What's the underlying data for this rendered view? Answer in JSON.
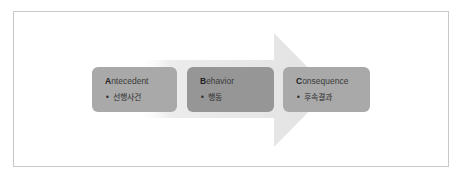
{
  "diagram": {
    "type": "process-arrow",
    "arrow_color": "#e4e4e4",
    "frame_border_color": "#c8c8c8",
    "steps": [
      {
        "initial": "A",
        "rest": "ntecedent",
        "title": "Antecedent",
        "bullet": "•",
        "subtitle": "선행사건",
        "color": "#a9a9a9"
      },
      {
        "initial": "B",
        "rest": "ehavior",
        "title": "Behavior",
        "bullet": "•",
        "subtitle": "행동",
        "color": "#969696"
      },
      {
        "initial": "C",
        "rest": "onsequence",
        "title": "Consequence",
        "bullet": "•",
        "subtitle": "후속결과",
        "color": "#a9a9a9"
      }
    ]
  }
}
